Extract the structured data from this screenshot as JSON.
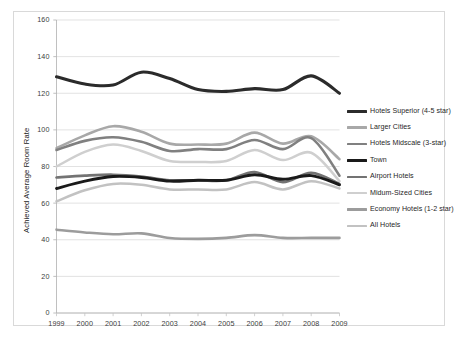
{
  "chart_data": {
    "type": "line",
    "title": "",
    "xlabel": "",
    "ylabel": "Achieved Average Room Rate",
    "x": [
      1999,
      2000,
      2001,
      2002,
      2003,
      2004,
      2005,
      2006,
      2007,
      2008,
      2009
    ],
    "xlim": [
      1999,
      2009
    ],
    "ylim": [
      0,
      160
    ],
    "yticks": [
      0,
      20,
      40,
      60,
      80,
      100,
      120,
      140,
      160
    ],
    "xticks": [
      "1999",
      "2000",
      "2001",
      "2002",
      "2003",
      "2004",
      "2005",
      "2006",
      "2007",
      "2008",
      "2009"
    ],
    "grid": "horizontal",
    "legend_position": "right",
    "smoothed": true,
    "series": [
      {
        "name": "Hotels Superior (4-5 star)",
        "color": "#2b2b2b",
        "width": 3.1,
        "values": [
          129,
          125,
          124.5,
          131.5,
          128,
          122,
          121,
          122.5,
          122,
          129.5,
          120
        ]
      },
      {
        "name": "Larger Cities",
        "color": "#a8a8a8",
        "width": 2.6,
        "values": [
          90,
          97,
          102,
          99,
          92.5,
          92,
          92.5,
          98.5,
          92.5,
          96.5,
          84
        ]
      },
      {
        "name": "Hotels Midscale (3-star)",
        "color": "#808080",
        "width": 2.6,
        "values": [
          89,
          94,
          96,
          93.5,
          88.5,
          89.5,
          89.5,
          94.5,
          89.5,
          95.5,
          75
        ]
      },
      {
        "name": "Town",
        "color": "#1a1a1a",
        "width": 2.9,
        "values": [
          68,
          72,
          74.5,
          74,
          72,
          72.5,
          72.5,
          75.5,
          73,
          75,
          70
        ]
      },
      {
        "name": "Airport Hotels",
        "color": "#737373",
        "width": 2.7,
        "values": [
          74,
          75,
          75.5,
          74.5,
          72.5,
          72.5,
          72.5,
          77,
          71.5,
          76.5,
          70.5
        ]
      },
      {
        "name": "Midum-Sized Cities",
        "color": "#cfcfcf",
        "width": 2.5,
        "values": [
          80,
          88,
          92,
          88.5,
          83,
          82.5,
          83,
          89,
          83.5,
          87.5,
          72
        ]
      },
      {
        "name": "Economy Hotels (1-2 star)",
        "color": "#9c9c9c",
        "width": 2.6,
        "values": [
          45.5,
          44,
          43,
          43.5,
          41,
          40.5,
          41,
          42.5,
          41,
          41,
          41
        ]
      },
      {
        "name": "All Hotels",
        "color": "#c2c2c2",
        "width": 2.5,
        "values": [
          61,
          67,
          70.5,
          70,
          67.5,
          67.5,
          67.5,
          71.5,
          67.5,
          72,
          68
        ]
      }
    ]
  }
}
